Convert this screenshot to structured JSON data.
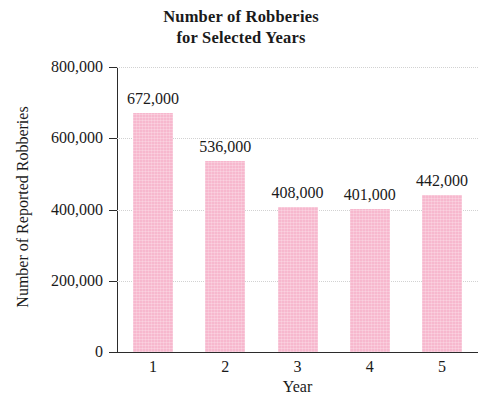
{
  "chart_data": {
    "type": "bar",
    "title": "Number of Robberies for Selected Years",
    "title_line1": "Number of Robberies",
    "title_line2": "for Selected Years",
    "xlabel": "Year",
    "ylabel": "Number of Reported Robberies",
    "categories": [
      "1",
      "2",
      "3",
      "4",
      "5"
    ],
    "values": [
      672000,
      536000,
      408000,
      401000,
      442000
    ],
    "value_labels": [
      "672,000",
      "536,000",
      "408,000",
      "401,000",
      "442,000"
    ],
    "ylim": [
      0,
      800000
    ],
    "yticks": [
      0,
      200000,
      400000,
      600000,
      800000
    ],
    "ytick_labels": [
      "0",
      "200,000",
      "400,000",
      "600,000",
      "800,000"
    ],
    "grid": true,
    "legend": null,
    "bar_color": "#f7b8ce",
    "axis_color": "#2b2b2b",
    "grid_color": "#d2d2d2"
  }
}
